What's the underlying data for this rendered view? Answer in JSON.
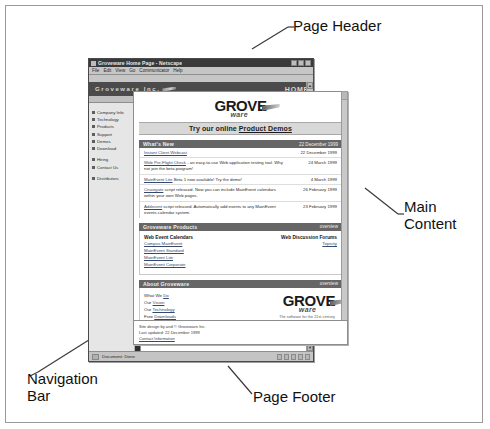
{
  "annotations": {
    "page_header": "Page Header",
    "main_content": "Main\nContent",
    "navigation_bar": "Navigation\nBar",
    "page_footer": "Page Footer"
  },
  "browser": {
    "title": "Groveware Home Page - Netscape",
    "menus": [
      "File",
      "Edit",
      "View",
      "Go",
      "Communicator",
      "Help"
    ],
    "window_buttons": [
      "minimize",
      "maximize",
      "close"
    ],
    "status_text": "Document: Done"
  },
  "site_header": {
    "banner_title": "Groveware Inc.",
    "home_label": "HOME",
    "subnav": [
      "news",
      "events"
    ]
  },
  "navigation": {
    "groups": [
      {
        "items": [
          "Company Info",
          "Technology",
          "Products",
          "Support",
          "Demos",
          "Download"
        ]
      },
      {
        "items": [
          "Hiring",
          "Contact Us"
        ]
      },
      {
        "items": [
          "Distributors"
        ]
      }
    ]
  },
  "logo": {
    "word_top": "GROVE",
    "word_bottom": "ware",
    "tagline": "The software for the 21st century"
  },
  "promo": {
    "prefix": "Try our online ",
    "link": "Product Demos"
  },
  "whats_new": {
    "title": "What's New",
    "header_date": "22 December 1999",
    "rows": [
      {
        "text": "Instant Client Webcast",
        "link": "Instant Client Webcast",
        "rest": "",
        "date": "22 December 1999"
      },
      {
        "link": "Web Pre-Flight Check",
        "rest": " - an easy-to-use Web application testing tool. Why not join the beta program!",
        "date": "24 March 1999"
      },
      {
        "link": "MainEvent Lite",
        "rest": " Beta 1 now available! Try the demo!",
        "date": "4 March 1999"
      },
      {
        "link": "Cnavigate",
        "rest": " script released. Now you can include MainEvent calendars within your own Web pages.",
        "date": "26 February 1999"
      },
      {
        "link": "Addevent",
        "rest": " script released. Automatically add events to any MainEvent events calendar system.",
        "date": "23 February 1999"
      }
    ]
  },
  "products": {
    "title": "Groveware Products",
    "overview_label": "overview",
    "columns": [
      {
        "heading": "Web Event Calendars",
        "links": [
          "Campus MainEvent",
          "MainEvent Standard",
          "MainEvent Lite",
          "MainEvent Corporate"
        ]
      },
      {
        "heading": "Web Discussion Forums",
        "links": [
          "Topicity"
        ]
      }
    ]
  },
  "about": {
    "title": "About Groveware",
    "overview_label": "overview",
    "lines": [
      {
        "prefix": "What We ",
        "link": "Do"
      },
      {
        "prefix": "Our ",
        "link": "Vision"
      },
      {
        "prefix": "Our ",
        "link": "Technology"
      },
      {
        "prefix": "Free ",
        "link": "Downloads"
      }
    ]
  },
  "footer": {
    "line1": "Site design by and © Groveware Inc.",
    "line2": "Last updated: 22 December 1999",
    "link": "Contact Information"
  }
}
